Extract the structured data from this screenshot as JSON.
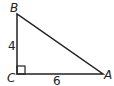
{
  "diagram": {
    "type": "right-triangle",
    "vertices": {
      "B": {
        "label": "B",
        "x": 17,
        "y": 14
      },
      "C": {
        "label": "C",
        "x": 17,
        "y": 74
      },
      "A": {
        "label": "A",
        "x": 103,
        "y": 74
      }
    },
    "sides": {
      "BC": {
        "label": "4"
      },
      "CA": {
        "label": "6"
      }
    },
    "right_angle_at": "C",
    "stroke_color": "#222222"
  }
}
